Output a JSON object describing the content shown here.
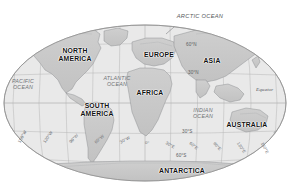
{
  "map": {
    "projection_shape": "oval-robinson",
    "bounds": {
      "left": 4,
      "top": 25,
      "right": 286,
      "bottom": 181
    },
    "colors": {
      "ocean_fill": "#e9e9e9",
      "land_fill": "#c9c9c9",
      "land_fill_dark": "#bdbdbd",
      "graticule": "#a9a9a9",
      "outline": "#9a9a9a",
      "coast": "#8a8d90",
      "continent_text": "#111111",
      "ocean_text": "#6f7276",
      "grid_text": "#5a5d61",
      "page_background": "#ffffff"
    },
    "continents": [
      {
        "id": "north-america",
        "label": "NORTH\nAMERICA",
        "line1": "NORTH",
        "line2": "AMERICA",
        "x": 75,
        "y": 55
      },
      {
        "id": "south-america",
        "label": "SOUTH\nAMERICA",
        "line1": "SOUTH",
        "line2": "AMERICA",
        "x": 97,
        "y": 110
      },
      {
        "id": "europe",
        "label": "EUROPE",
        "line1": "EUROPE",
        "line2": "",
        "x": 159,
        "y": 55
      },
      {
        "id": "asia",
        "label": "ASIA",
        "line1": "ASIA",
        "line2": "",
        "x": 212,
        "y": 61
      },
      {
        "id": "africa",
        "label": "AFRICA",
        "line1": "AFRICA",
        "line2": "",
        "x": 150,
        "y": 93
      },
      {
        "id": "australia",
        "label": "AUSTRALIA",
        "line1": "AUSTRALIA",
        "line2": "",
        "x": 247,
        "y": 125
      },
      {
        "id": "antarctica",
        "label": "ANTARCTICA",
        "line1": "ANTARCTICA",
        "line2": "",
        "x": 182,
        "y": 171
      }
    ],
    "oceans": [
      {
        "id": "arctic-ocean",
        "label": "ARCTIC OCEAN",
        "line1": "ARCTIC OCEAN",
        "line2": "",
        "x": 200,
        "y": 17,
        "leader": true
      },
      {
        "id": "pacific-ocean",
        "label": "PACIFIC\nOCEAN",
        "line1": "PACIFIC",
        "line2": "OCEAN",
        "x": 22,
        "y": 84
      },
      {
        "id": "atlantic-ocean",
        "label": "ATLANTIC\nOCEAN",
        "line1": "ATLANTIC",
        "line2": "OCEAN",
        "x": 116,
        "y": 81
      },
      {
        "id": "indian-ocean",
        "label": "INDIAN\nOCEAN",
        "line1": "INDIAN",
        "line2": "OCEAN",
        "x": 202,
        "y": 113
      }
    ],
    "latitude_labels": [
      {
        "id": "lat-60n",
        "label": "60°N",
        "x": 186,
        "y": 44
      },
      {
        "id": "lat-30n",
        "label": "30°N",
        "x": 188,
        "y": 72
      },
      {
        "id": "lat-equator",
        "label": "Equator",
        "x": 257,
        "y": 88
      },
      {
        "id": "lat-30s",
        "label": "30°S",
        "x": 182,
        "y": 131
      },
      {
        "id": "lat-60s",
        "label": "60°S",
        "x": 178,
        "y": 155
      }
    ],
    "longitude_labels": [
      {
        "id": "lon-150w",
        "label": "150°W",
        "x": 19,
        "y": 140,
        "rotate": -62
      },
      {
        "id": "lon-120w",
        "label": "120°W",
        "x": 44,
        "y": 140,
        "rotate": -56
      },
      {
        "id": "lon-90w",
        "label": "90°W",
        "x": 70,
        "y": 140,
        "rotate": -48
      },
      {
        "id": "lon-60w",
        "label": "60°W",
        "x": 95,
        "y": 140,
        "rotate": -40
      },
      {
        "id": "lon-30w",
        "label": "30°W",
        "x": 120,
        "y": 140,
        "rotate": -30
      },
      {
        "id": "lon-0",
        "label": "0°",
        "x": 145,
        "y": 140,
        "rotate": 0
      },
      {
        "id": "lon-30e",
        "label": "30°E",
        "x": 166,
        "y": 140,
        "rotate": 30
      },
      {
        "id": "lon-60e",
        "label": "60°E",
        "x": 190,
        "y": 140,
        "rotate": 40
      },
      {
        "id": "lon-90e",
        "label": "90°E",
        "x": 214,
        "y": 140,
        "rotate": 48
      },
      {
        "id": "lon-120e",
        "label": "120°E",
        "x": 238,
        "y": 140,
        "rotate": 56
      },
      {
        "id": "lon-150e",
        "label": "150°E",
        "x": 262,
        "y": 140,
        "rotate": 62
      }
    ]
  }
}
